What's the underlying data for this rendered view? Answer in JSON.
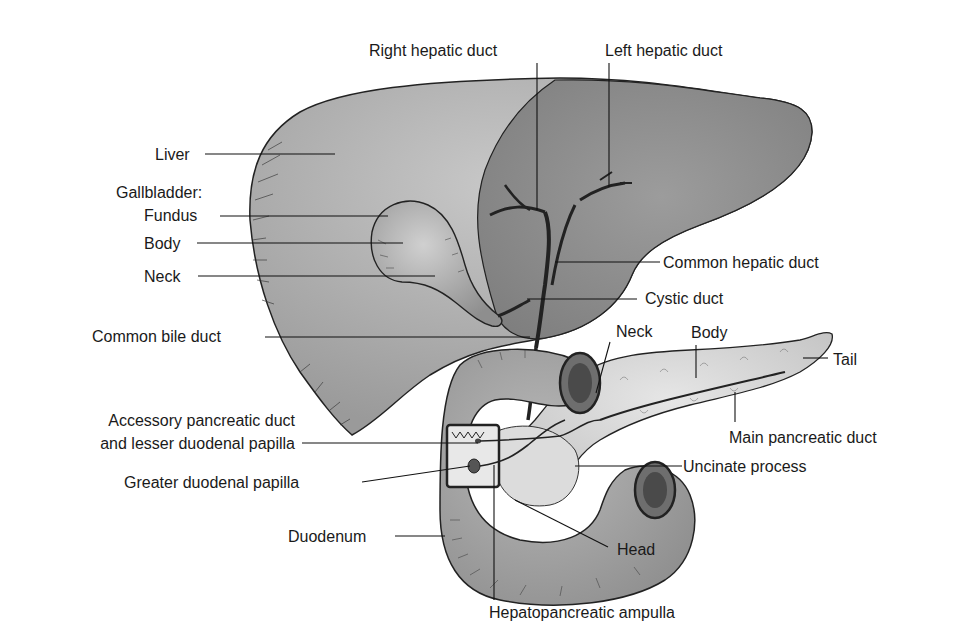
{
  "figure": {
    "colors": {
      "background": "#ffffff",
      "liver_light": "#b9b9b9",
      "liver_dark": "#8a8a8a",
      "gallbladder": "#a4a4a4",
      "duodenum": "#a0a0a0",
      "pancreas": "#d4d4d4",
      "ink": "#1a1a1a"
    }
  },
  "labels": {
    "right_hepatic_duct": "Right hepatic duct",
    "left_hepatic_duct": "Left hepatic duct",
    "liver": "Liver",
    "gallbladder_heading": "Gallbladder:",
    "fundus": "Fundus",
    "body_gb": "Body",
    "neck_gb": "Neck",
    "common_hepatic_duct": "Common hepatic duct",
    "cystic_duct": "Cystic duct",
    "common_bile_duct": "Common bile duct",
    "neck_pancreas": "Neck",
    "body_pancreas": "Body",
    "tail": "Tail",
    "accessory_line1": "Accessory pancreatic duct",
    "accessory_line2": "and lesser duodenal papilla",
    "main_pancreatic_duct": "Main pancreatic duct",
    "uncinate_process": "Uncinate process",
    "greater_duodenal_papilla": "Greater duodenal papilla",
    "duodenum": "Duodenum",
    "head": "Head",
    "hepatopancreatic_ampulla": "Hepatopancreatic ampulla"
  }
}
